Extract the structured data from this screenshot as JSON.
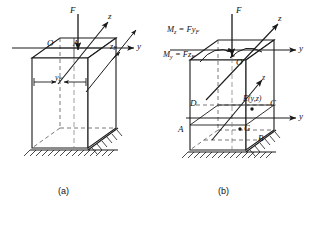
{
  "figure": {
    "caption_a": "(a)",
    "caption_b": "(b)",
    "stroke": "#1a1a1a",
    "hidden_stroke": "#555555"
  },
  "panel_a": {
    "origin_label": "O",
    "point_a_label": "A",
    "force_label": "F",
    "axis_z_label": "z",
    "axis_y_label": "y",
    "dim_zf": "z",
    "dim_zf_sub": "F",
    "dim_yf": "y",
    "dim_yf_sub": "F"
  },
  "panel_b": {
    "moment_z_label": "M",
    "moment_z_sub": "z",
    "moment_z_expr": " = Fy",
    "moment_z_expr_sub": "F",
    "moment_y_label": "M",
    "moment_y_sub": "y",
    "moment_y_expr": " = Fz",
    "moment_y_expr_sub": "F",
    "force_label": "F",
    "axis_z_top_label": "z",
    "axis_y_top_label": "y",
    "axis_z_mid_label": "z",
    "axis_y_mid_label": "y",
    "origin_label": "O",
    "corner_d": "D",
    "corner_c": "C",
    "corner_a": "A",
    "corner_b": "B",
    "point_e": "E(y,z)",
    "point_g": "G"
  }
}
